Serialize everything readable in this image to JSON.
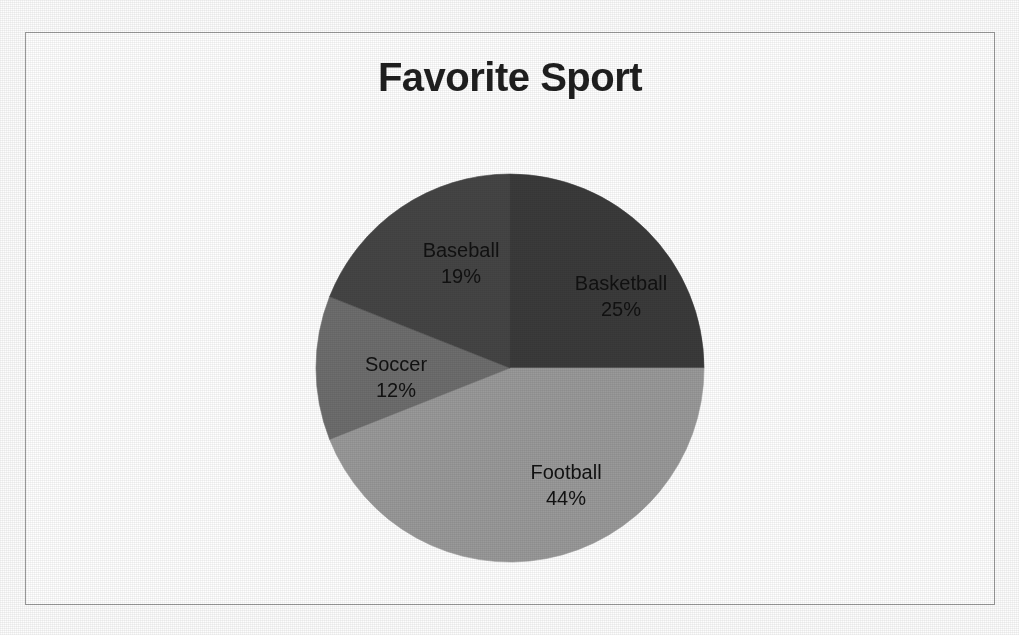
{
  "chart_data": {
    "type": "pie",
    "title": "Favorite Sport",
    "categories": [
      "Basketball",
      "Football",
      "Soccer",
      "Baseball"
    ],
    "values": [
      25,
      44,
      12,
      19
    ],
    "value_unit": "%",
    "labels": [
      "25%",
      "44%",
      "12%",
      "19%"
    ],
    "slice_colors": [
      "#3b3b3b",
      "#9a9a9a",
      "#6e6e6e",
      "#454545"
    ],
    "start_angle_deg": 0,
    "direction": "clockwise",
    "legend": "none",
    "data_labels": "category-and-percentage",
    "slices": [
      {
        "name": "Basketball",
        "value": 25,
        "label": "25%",
        "color": "#3b3b3b"
      },
      {
        "name": "Football",
        "value": 44,
        "label": "44%",
        "color": "#9a9a9a"
      },
      {
        "name": "Soccer",
        "value": 12,
        "label": "12%",
        "color": "#6e6e6e"
      },
      {
        "name": "Baseball",
        "value": 19,
        "label": "19%",
        "color": "#454545"
      }
    ]
  },
  "chart": {
    "title": "Favorite Sport",
    "border_color": "#9b9b9b",
    "background": "#ffffff",
    "label_color": "#111111"
  },
  "labels": {
    "basketball": {
      "category": "Basketball",
      "percent": "25%"
    },
    "football": {
      "category": "Football",
      "percent": "44%"
    },
    "soccer": {
      "category": "Soccer",
      "percent": "12%"
    },
    "baseball": {
      "category": "Baseball",
      "percent": "19%"
    }
  }
}
